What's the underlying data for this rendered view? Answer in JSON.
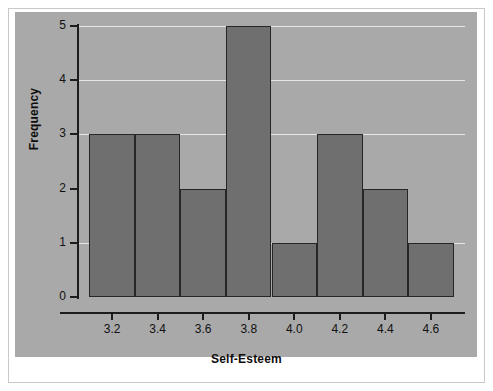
{
  "chart_data": {
    "type": "bar",
    "title": "",
    "xlabel": "Self-Esteem",
    "ylabel": "Frequency",
    "categories": [
      "3.1-3.3",
      "3.3-3.5",
      "3.5-3.7",
      "3.7-3.9",
      "3.9-4.1",
      "4.1-4.3",
      "4.3-4.5",
      "4.5-4.7"
    ],
    "bin_edges": [
      3.1,
      3.3,
      3.5,
      3.7,
      3.9,
      4.1,
      4.3,
      4.5,
      4.7
    ],
    "values": [
      3,
      3,
      2,
      5,
      1,
      3,
      2,
      1
    ],
    "xtick_labels": [
      "3.2",
      "3.4",
      "3.6",
      "3.8",
      "4.0",
      "4.2",
      "4.4",
      "4.6"
    ],
    "xtick_values": [
      3.2,
      3.4,
      3.6,
      3.8,
      4.0,
      4.2,
      4.4,
      4.6
    ],
    "ytick_labels": [
      "0",
      "1",
      "2",
      "3",
      "4",
      "5"
    ],
    "ytick_values": [
      0,
      1,
      2,
      3,
      4,
      5
    ],
    "ylim": [
      0,
      5
    ],
    "xlim": [
      3.05,
      4.75
    ],
    "grid": true,
    "gridlines_at": [
      1,
      3,
      4,
      5
    ],
    "legend": null,
    "colors": {
      "bar_fill": "#6f6f6f",
      "bar_edge": "#262626",
      "panel_background": "#a9a9a9",
      "gridline": "#e6e6e6",
      "axis": "#1c1c1c",
      "text": "#111111",
      "figure_background": "#ffffff"
    }
  }
}
